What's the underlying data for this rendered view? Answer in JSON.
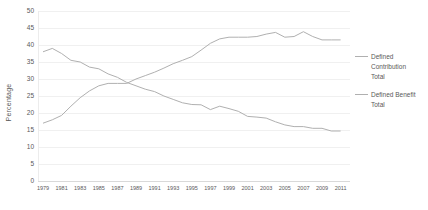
{
  "chart_data": {
    "type": "line",
    "title": "",
    "xlabel": "",
    "ylabel": "Percentage",
    "ylim": [
      0,
      50
    ],
    "y_ticks": [
      0,
      5,
      10,
      15,
      20,
      25,
      30,
      35,
      40,
      45,
      50
    ],
    "x": [
      1979,
      1980,
      1981,
      1982,
      1983,
      1984,
      1985,
      1986,
      1987,
      1988,
      1989,
      1990,
      1991,
      1992,
      1993,
      1994,
      1995,
      1996,
      1997,
      1998,
      1999,
      2000,
      2001,
      2002,
      2003,
      2004,
      2005,
      2006,
      2007,
      2008,
      2009,
      2010,
      2011
    ],
    "x_tick_labels": [
      "1979",
      "1981",
      "1983",
      "1985",
      "1987",
      "1989",
      "1991",
      "1993",
      "1995",
      "1997",
      "1999",
      "2001",
      "2003",
      "2005",
      "2007",
      "2009",
      "2011"
    ],
    "grid": true,
    "legend_position": "right",
    "series": [
      {
        "name": "Defined Contribution Total",
        "color": "#b0b0b0",
        "values": [
          17,
          18,
          19.3,
          22,
          24.5,
          26.5,
          28,
          28.7,
          28.7,
          28.7,
          30,
          31,
          32,
          33.2,
          34.5,
          35.5,
          36.6,
          38.5,
          40.5,
          41.8,
          42.3,
          42.3,
          42.3,
          42.5,
          43.2,
          43.7,
          42.3,
          42.5,
          43.9,
          42.5,
          41.5,
          41.5,
          41.5
        ]
      },
      {
        "name": "Defined Benefit Total",
        "color": "#b0b0b0",
        "values": [
          38,
          39,
          37.5,
          35.5,
          35,
          33.5,
          33,
          31.5,
          30.5,
          29,
          28,
          27,
          26.3,
          25,
          24,
          23,
          22.5,
          22.4,
          21,
          22,
          21.3,
          20.5,
          19,
          18.8,
          18.5,
          17.4,
          16.5,
          16,
          16,
          15.5,
          15.5,
          14.7,
          14.7
        ]
      }
    ]
  },
  "colors": {
    "background": "#ffffff",
    "grid": "#f0f0f0",
    "axis": "#d9d9d9",
    "text": "#595959",
    "line": "#b0b0b0"
  }
}
